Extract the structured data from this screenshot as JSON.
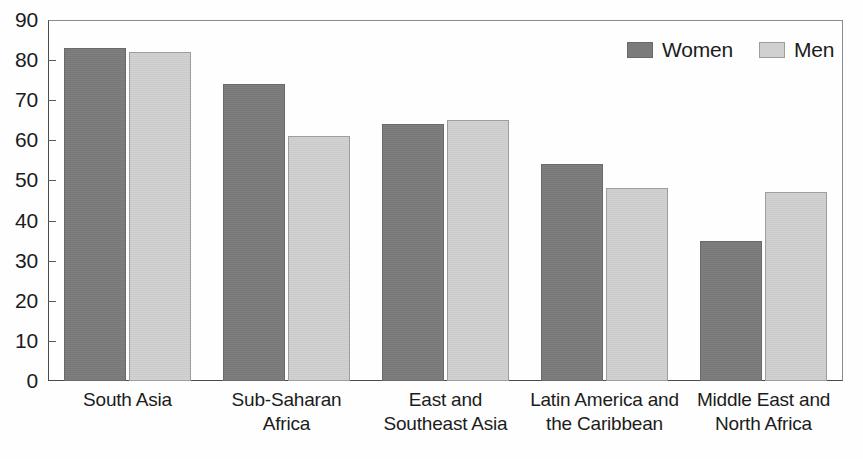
{
  "chart_data": {
    "type": "bar",
    "title": "",
    "xlabel": "",
    "ylabel": "",
    "ylim": [
      0,
      90
    ],
    "grid": false,
    "legend_position": "top-right",
    "categories": [
      "South Asia",
      "Sub-Saharan Africa",
      "East and Southeast Asia",
      "Latin America and the Caribbean",
      "Middle East and North Africa"
    ],
    "category_lines": [
      [
        "South Asia"
      ],
      [
        "Sub-Saharan",
        "Africa"
      ],
      [
        "East and",
        "Southeast Asia"
      ],
      [
        "Latin America and",
        "the Caribbean"
      ],
      [
        "Middle East and",
        "North Africa"
      ]
    ],
    "series": [
      {
        "name": "Women",
        "color": "#7b7b7b",
        "values": [
          83,
          74,
          64,
          54,
          35
        ]
      },
      {
        "name": "Men",
        "color": "#d0d0d0",
        "values": [
          82,
          61,
          65,
          48,
          47
        ]
      }
    ],
    "y_ticks": [
      0,
      10,
      20,
      30,
      40,
      50,
      60,
      70,
      80,
      90
    ]
  },
  "legend": {
    "items": [
      {
        "label": "Women",
        "swatch": "women-swatch"
      },
      {
        "label": "Men",
        "swatch": "men-swatch"
      }
    ]
  },
  "colors": {
    "women": "#7b7b7b",
    "men": "#d0d0d0",
    "axis": "#4a4a4a",
    "text": "#1c1c1c",
    "background": "#fefefe"
  }
}
